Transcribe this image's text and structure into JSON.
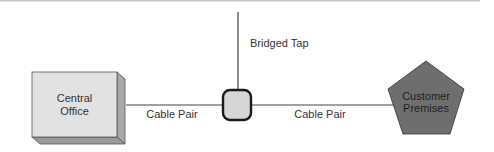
{
  "diagram": {
    "nodes": {
      "central_office": {
        "line1": "Central",
        "line2": "Office",
        "fill": "#e2e2e2",
        "shape": "3d-box"
      },
      "junction": {
        "fill": "#d6d6d6",
        "stroke": "#1a1a1a",
        "shape": "rounded-square"
      },
      "customer_premises": {
        "line1": "Customer",
        "line2": "Premises",
        "fill": "#6e6e6e",
        "shape": "pentagon"
      }
    },
    "edges": [
      {
        "from": "central_office",
        "to": "junction",
        "label": "Cable Pair"
      },
      {
        "from": "junction",
        "to": "bridged_tap_end",
        "label": "Bridged Tap"
      },
      {
        "from": "junction",
        "to": "customer_premises",
        "label": "Cable Pair"
      }
    ],
    "colors": {
      "line": "#444444",
      "top_rule": "#c8c8c8"
    }
  }
}
